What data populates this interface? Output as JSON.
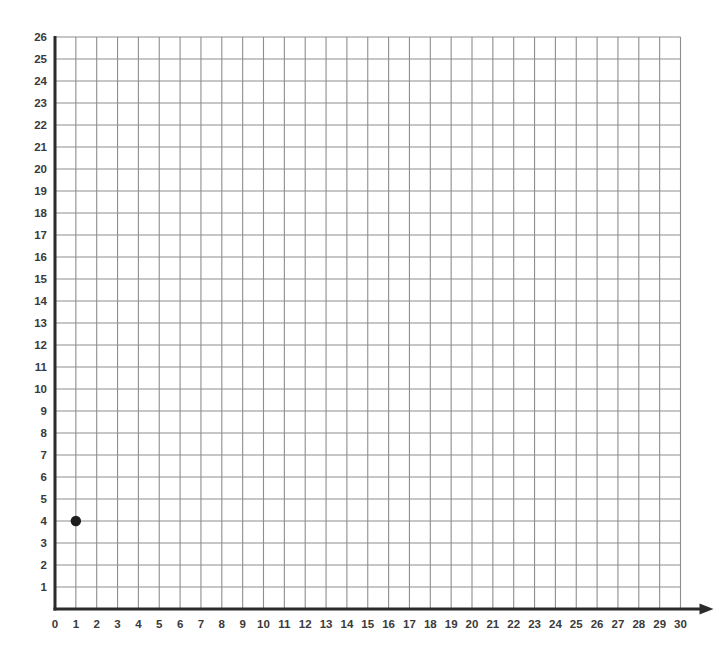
{
  "chart_data": {
    "type": "scatter",
    "title": "",
    "subtitle": "",
    "xlabel": "X",
    "ylabel": "",
    "xlim": [
      0,
      30
    ],
    "ylim": [
      0,
      26
    ],
    "xtick_step": 1,
    "ytick_step": 1,
    "grid": true,
    "legend": null,
    "xticks": [
      0,
      1,
      2,
      3,
      4,
      5,
      6,
      7,
      8,
      9,
      10,
      11,
      12,
      13,
      14,
      15,
      16,
      17,
      18,
      19,
      20,
      21,
      22,
      23,
      24,
      25,
      26,
      27,
      28,
      29,
      30
    ],
    "yticks": [
      1,
      2,
      3,
      4,
      5,
      6,
      7,
      8,
      9,
      10,
      11,
      12,
      13,
      14,
      15,
      16,
      17,
      18,
      19,
      20,
      21,
      22,
      23,
      24,
      25,
      26
    ],
    "points": [
      {
        "label": "point-1",
        "x": 1,
        "y": 4
      }
    ],
    "series": [
      {
        "name": "plotted points",
        "x": [
          1
        ],
        "y": [
          4
        ]
      }
    ],
    "annotations": [
      {
        "name": "x-axis-arrowhead",
        "text": "",
        "kind": "arrow"
      },
      {
        "name": "x-axis-label",
        "text": "X",
        "kind": "axis-title"
      }
    ],
    "colors": {
      "background": "#ffffff",
      "gridline": "#8e8e8e",
      "axis": "#2b2b2b",
      "point": "#1d1d1d",
      "tick_label": "#3a3a3a",
      "axis_title": "#2b2b2b"
    }
  },
  "geometry": {
    "origin_x_px": 55,
    "origin_y_px": 609,
    "x_spacing_px": 20.85,
    "y_spacing_px": 22.0,
    "point_radius_px": 5.2
  }
}
